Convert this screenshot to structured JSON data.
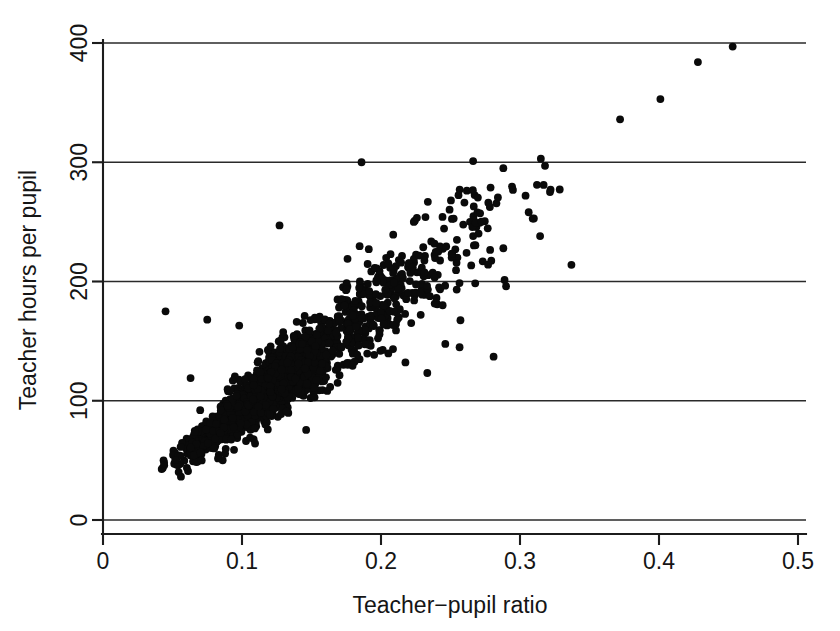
{
  "chart_data": {
    "type": "scatter",
    "title": "",
    "xlabel": "Teacher−pupil ratio",
    "ylabel": "Teacher hours per pupil",
    "xlim": [
      0,
      0.5
    ],
    "ylim": [
      0,
      400
    ],
    "xticks": [
      0,
      0.1,
      0.2,
      0.3,
      0.4,
      0.5
    ],
    "xticklabels": [
      "0",
      "0.1",
      "0.2",
      "0.3",
      "0.4",
      "0.5"
    ],
    "yticks": [
      0,
      100,
      200,
      300,
      400
    ],
    "yticklabels": [
      "0",
      "100",
      "200",
      "300",
      "400"
    ],
    "grid": "horizontal-only",
    "legend": "none",
    "marker": {
      "shape": "circle",
      "color": "#0a0a0a",
      "radius_px": 3.9,
      "filled": true
    },
    "n_points_approx": 1650,
    "relationship": {
      "direction": "positive",
      "approx_slope_hours_per_ratio": 880,
      "approx_intercept_hours": 5
    },
    "cloud": {
      "x_range": [
        0.042,
        0.345
      ],
      "y_range": [
        38,
        305
      ],
      "core_x_range": [
        0.07,
        0.22
      ],
      "core_y_range": [
        60,
        200
      ],
      "spread_note": "vertical scatter widens with x; band half-width grows from ~12 hours at x=0.05 to ~45 hours at x=0.25"
    },
    "outliers": [
      {
        "x": 0.453,
        "y": 397
      },
      {
        "x": 0.428,
        "y": 384
      },
      {
        "x": 0.401,
        "y": 353
      },
      {
        "x": 0.372,
        "y": 336
      },
      {
        "x": 0.315,
        "y": 303
      },
      {
        "x": 0.318,
        "y": 297
      },
      {
        "x": 0.288,
        "y": 295
      },
      {
        "x": 0.186,
        "y": 300
      },
      {
        "x": 0.317,
        "y": 281
      },
      {
        "x": 0.322,
        "y": 277
      },
      {
        "x": 0.304,
        "y": 272
      },
      {
        "x": 0.127,
        "y": 247
      },
      {
        "x": 0.232,
        "y": 254
      },
      {
        "x": 0.337,
        "y": 214
      },
      {
        "x": 0.29,
        "y": 196
      },
      {
        "x": 0.281,
        "y": 137
      },
      {
        "x": 0.045,
        "y": 175
      },
      {
        "x": 0.075,
        "y": 168
      },
      {
        "x": 0.063,
        "y": 119
      },
      {
        "x": 0.098,
        "y": 163
      }
    ],
    "seed": 20240517
  },
  "axes": {
    "x_axis_name": "x-axis",
    "y_axis_name": "y-axis"
  }
}
